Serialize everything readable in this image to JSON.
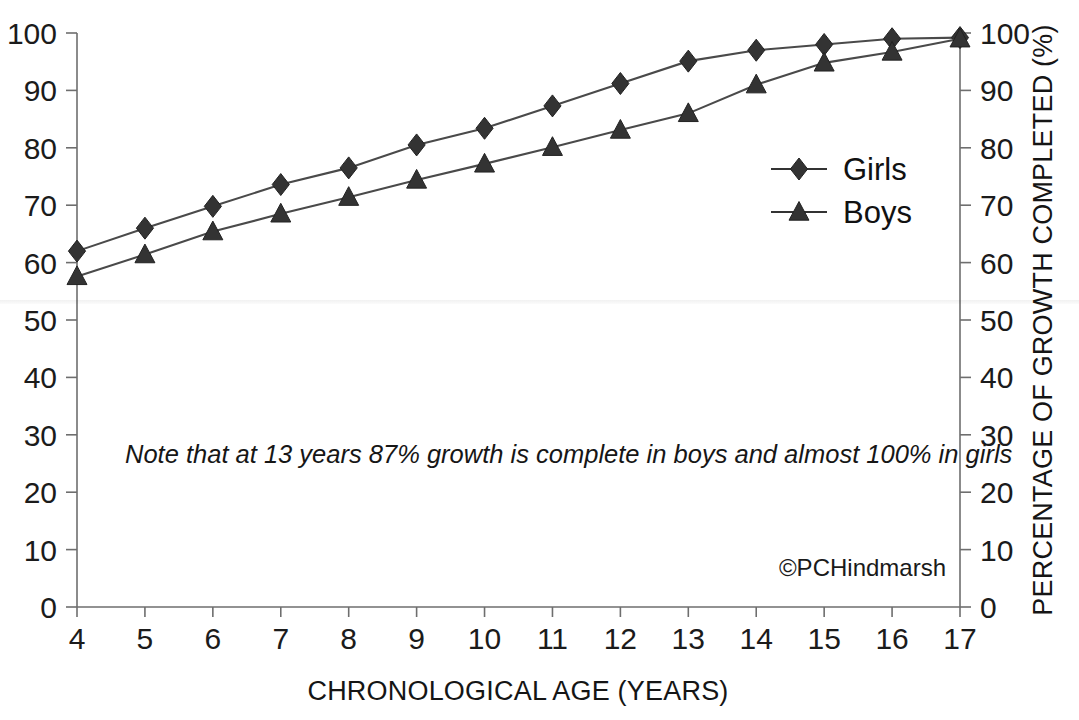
{
  "chart_data": {
    "type": "line",
    "title": "",
    "xlabel": "CHRONOLOGICAL AGE (YEARS)",
    "ylabel_right": "PERCENTAGE OF GROWTH COMPLETED (%)",
    "ylabel_left": "",
    "x": [
      4,
      5,
      6,
      7,
      8,
      9,
      10,
      11,
      12,
      13,
      14,
      15,
      16,
      17
    ],
    "categories": [
      "4",
      "5",
      "6",
      "7",
      "8",
      "9",
      "10",
      "11",
      "12",
      "13",
      "14",
      "15",
      "16",
      "17"
    ],
    "xlim": [
      4,
      17
    ],
    "ylim": [
      0,
      100
    ],
    "y_ticks": [
      0,
      10,
      20,
      30,
      40,
      50,
      60,
      70,
      80,
      90,
      100
    ],
    "y_tick_labels": [
      "0",
      "10",
      "20",
      "30",
      "40",
      "50",
      "60",
      "70",
      "80",
      "90",
      "100"
    ],
    "x_ticks": [
      4,
      5,
      6,
      7,
      8,
      9,
      10,
      11,
      12,
      13,
      14,
      15,
      16,
      17
    ],
    "x_tick_labels": [
      "4",
      "5",
      "6",
      "7",
      "8",
      "9",
      "10",
      "11",
      "12",
      "13",
      "14",
      "15",
      "16",
      "17"
    ],
    "grid": false,
    "legend_position": "center-right",
    "series": [
      {
        "name": "Girls",
        "marker": "diamond",
        "color": "#333333",
        "values": [
          62.0,
          66.0,
          69.8,
          73.6,
          76.5,
          80.5,
          83.4,
          87.3,
          91.2,
          95.1,
          97.0,
          98.0,
          99.0,
          99.2
        ]
      },
      {
        "name": "Boys",
        "marker": "triangle",
        "color": "#333333",
        "values": [
          57.6,
          61.4,
          65.4,
          68.5,
          71.4,
          74.4,
          77.2,
          80.1,
          83.1,
          86.0,
          91.0,
          94.8,
          96.7,
          99.0
        ]
      }
    ],
    "annotations": [
      {
        "name": "growth-note",
        "text": "Note that at 13 years 87% growth is complete in boys and almost 100% in girls",
        "x": 4.6,
        "y": 26.5,
        "style": "italic"
      },
      {
        "name": "copyright",
        "text": "©PCHindmarsh",
        "x": 15.9,
        "y": 8.5,
        "style": "normal"
      }
    ]
  },
  "legend": {
    "items": [
      {
        "label": "Girls",
        "marker": "diamond"
      },
      {
        "label": "Boys",
        "marker": "triangle"
      }
    ]
  },
  "axes": {
    "x_title": "CHRONOLOGICAL AGE (YEARS)",
    "right_title": "PERCENTAGE OF GROWTH COMPLETED (%)"
  },
  "colors": {
    "series": "#333333",
    "axis": "#6e6e6e",
    "text": "#151515",
    "background": "#ffffff"
  }
}
